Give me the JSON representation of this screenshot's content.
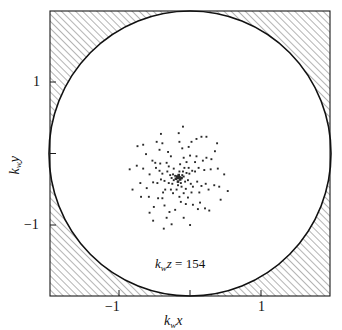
{
  "figure": {
    "type": "scatter",
    "background_color": "#ffffff",
    "frame_color": "#1a1a1a",
    "point_color": "#2a2a2a",
    "hatch_color": "#6e6e6e"
  },
  "axes": {
    "x_title_main": "k",
    "x_title_sub": "w",
    "x_title_var": "x",
    "y_title_main": "k",
    "y_title_sub": "w",
    "y_title_var": "y",
    "x_ticks": [
      {
        "label": "−1",
        "value": -1
      },
      {
        "label": "1",
        "value": 1
      }
    ],
    "y_ticks": [
      {
        "label": "1",
        "value": 1
      },
      {
        "label": "−1",
        "value": -1
      }
    ]
  },
  "annotation": {
    "main": "k",
    "sub": "w",
    "var": "z",
    "equals": " = ",
    "value": "154",
    "full_text": "k_w z = 154"
  },
  "chart_data": {
    "type": "scatter",
    "title": "",
    "xlabel": "k_w x",
    "ylabel": "k_w y",
    "xlim": [
      -1.97,
      1.97
    ],
    "ylim": [
      -1.97,
      1.97
    ],
    "grid": false,
    "legend": null,
    "annotations": [
      {
        "text": "k_w z = 154",
        "x": 0.0,
        "y": -1.48
      }
    ],
    "shapes": [
      {
        "kind": "circle",
        "cx": 0.0,
        "cy": 0.0,
        "r": 1.99,
        "note": "unit-circle boundary; region outside is hatched"
      }
    ],
    "series": [
      {
        "name": "ray points",
        "marker": "square",
        "color": "#2a2a2a",
        "points": [
          [
            0.0,
            0.0
          ],
          [
            0.02,
            0.01
          ],
          [
            -0.01,
            0.02
          ],
          [
            0.03,
            -0.02
          ],
          [
            -0.03,
            -0.01
          ],
          [
            0.01,
            0.04
          ],
          [
            0.05,
            0.0
          ],
          [
            -0.04,
            0.03
          ],
          [
            0.0,
            -0.05
          ],
          [
            0.06,
            0.04
          ],
          [
            -0.06,
            -0.03
          ],
          [
            0.04,
            -0.07
          ],
          [
            -0.07,
            0.05
          ],
          [
            0.08,
            0.02
          ],
          [
            0.02,
            0.09
          ],
          [
            -0.09,
            0.0
          ],
          [
            0.0,
            -0.1
          ],
          [
            0.1,
            -0.05
          ],
          [
            -0.08,
            -0.08
          ],
          [
            0.07,
            0.09
          ],
          [
            -0.11,
            0.04
          ],
          [
            0.12,
            0.07
          ],
          [
            0.05,
            -0.12
          ],
          [
            -0.06,
            0.13
          ],
          [
            0.14,
            -0.03
          ],
          [
            -0.13,
            -0.07
          ],
          [
            0.09,
            0.14
          ],
          [
            -0.02,
            -0.16
          ],
          [
            0.16,
            0.06
          ],
          [
            -0.15,
            0.09
          ],
          [
            0.11,
            -0.15
          ],
          [
            -0.1,
            -0.16
          ],
          [
            0.18,
            -0.08
          ],
          [
            0.03,
            0.19
          ],
          [
            -0.19,
            -0.04
          ],
          [
            0.15,
            0.14
          ],
          [
            -0.13,
            0.16
          ],
          [
            0.2,
            0.1
          ],
          [
            -0.07,
            -0.21
          ],
          [
            0.08,
            -0.21
          ],
          [
            -0.22,
            0.06
          ],
          [
            0.21,
            -0.12
          ],
          [
            0.12,
            0.22
          ],
          [
            -0.18,
            -0.16
          ],
          [
            -0.24,
            -0.02
          ],
          [
            0.24,
            0.09
          ],
          [
            0.02,
            -0.26
          ],
          [
            -0.16,
            0.21
          ],
          [
            0.19,
            -0.2
          ],
          [
            -0.26,
            0.1
          ],
          [
            0.27,
            -0.05
          ],
          [
            0.08,
            0.28
          ],
          [
            -0.21,
            -0.2
          ],
          [
            0.14,
            -0.27
          ],
          [
            -0.29,
            -0.07
          ],
          [
            0.29,
            0.14
          ],
          [
            -0.1,
            0.3
          ],
          [
            0.24,
            0.22
          ],
          [
            -0.25,
            0.2
          ],
          [
            0.04,
            -0.33
          ],
          [
            -0.31,
            0.14
          ],
          [
            0.33,
            -0.11
          ],
          [
            0.17,
            0.31
          ],
          [
            -0.22,
            -0.28
          ],
          [
            0.3,
            -0.2
          ],
          [
            -0.35,
            -0.06
          ],
          [
            0.11,
            -0.36
          ],
          [
            -0.14,
            0.36
          ],
          [
            0.37,
            0.11
          ],
          [
            -0.32,
            0.21
          ],
          [
            0.26,
            0.3
          ],
          [
            -0.28,
            -0.28
          ],
          [
            0.39,
            -0.08
          ],
          [
            -0.4,
            0.05
          ],
          [
            0.06,
            0.41
          ],
          [
            0.21,
            -0.37
          ],
          [
            -0.19,
            -0.38
          ],
          [
            0.35,
            0.24
          ],
          [
            -0.36,
            0.24
          ],
          [
            -0.04,
            -0.44
          ],
          [
            0.43,
            -0.16
          ],
          [
            0.15,
            0.43
          ],
          [
            -0.44,
            -0.14
          ],
          [
            0.31,
            -0.34
          ],
          [
            -0.26,
            0.39
          ],
          [
            0.46,
            0.12
          ],
          [
            -0.12,
            -0.47
          ],
          [
            0.4,
            0.28
          ],
          [
            -0.41,
            -0.26
          ],
          [
            0.02,
            0.5
          ],
          [
            -0.49,
            0.13
          ],
          [
            0.28,
            -0.43
          ],
          [
            0.51,
            -0.1
          ],
          [
            -0.22,
            0.48
          ],
          [
            -0.34,
            -0.4
          ],
          [
            0.19,
            0.5
          ],
          [
            0.47,
            0.26
          ],
          [
            -0.53,
            -0.07
          ],
          [
            0.08,
            -0.55
          ],
          [
            -0.45,
            0.33
          ],
          [
            0.38,
            -0.42
          ],
          [
            -0.16,
            -0.55
          ],
          [
            0.56,
            0.13
          ],
          [
            -0.3,
            0.5
          ],
          [
            0.26,
            0.54
          ],
          [
            -0.52,
            -0.26
          ],
          [
            0.58,
            -0.12
          ],
          [
            -0.58,
            0.17
          ],
          [
            0.01,
            0.62
          ],
          [
            0.44,
            -0.45
          ],
          [
            -0.4,
            -0.48
          ],
          [
            0.52,
            0.37
          ],
          [
            -0.09,
            -0.64
          ],
          [
            -0.24,
            0.61
          ],
          [
            0.33,
            0.57
          ],
          [
            0.65,
            0.05
          ],
          [
            -0.64,
            -0.16
          ],
          [
            0.17,
            -0.65
          ],
          [
            -0.49,
            0.46
          ],
          [
            0.6,
            -0.3
          ],
          [
            -0.35,
            -0.59
          ],
          [
            0.4,
            0.57
          ],
          [
            -0.68,
            0.12
          ],
          [
            0.07,
            0.71
          ],
          [
            0.7,
            -0.18
          ],
          [
            -0.2,
            -0.7
          ],
          [
            -0.57,
            0.44
          ],
          [
            0.55,
            0.48
          ]
        ]
      }
    ]
  }
}
